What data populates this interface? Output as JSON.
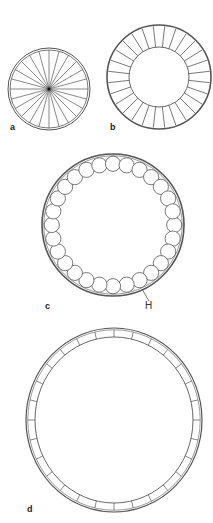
{
  "figure": {
    "panels": [
      {
        "id": "a",
        "label": "a",
        "type": "spoked-wheel",
        "cx": 49,
        "cy": 89,
        "r": 41,
        "spokes": 24
      },
      {
        "id": "b",
        "label": "b",
        "type": "segmented-ring",
        "cx": 159,
        "cy": 77,
        "r_outer": 52,
        "r_inner": 30,
        "segments": 28
      },
      {
        "id": "c",
        "label": "c",
        "type": "ring-of-circles",
        "cx": 113,
        "cy": 225,
        "r": 71,
        "circles": 28,
        "circle_r": 7.6,
        "annotation": "H"
      },
      {
        "id": "d",
        "label": "d",
        "type": "thin-segmented-ring",
        "cx": 114,
        "cy": 420,
        "rx": 88,
        "ry": 92,
        "band": 9,
        "segments": 28
      }
    ],
    "stroke_color": "#555555",
    "background": "#ffffff"
  },
  "labels": {
    "a": "a",
    "b": "b",
    "c": "c",
    "d": "d",
    "h": "H"
  }
}
